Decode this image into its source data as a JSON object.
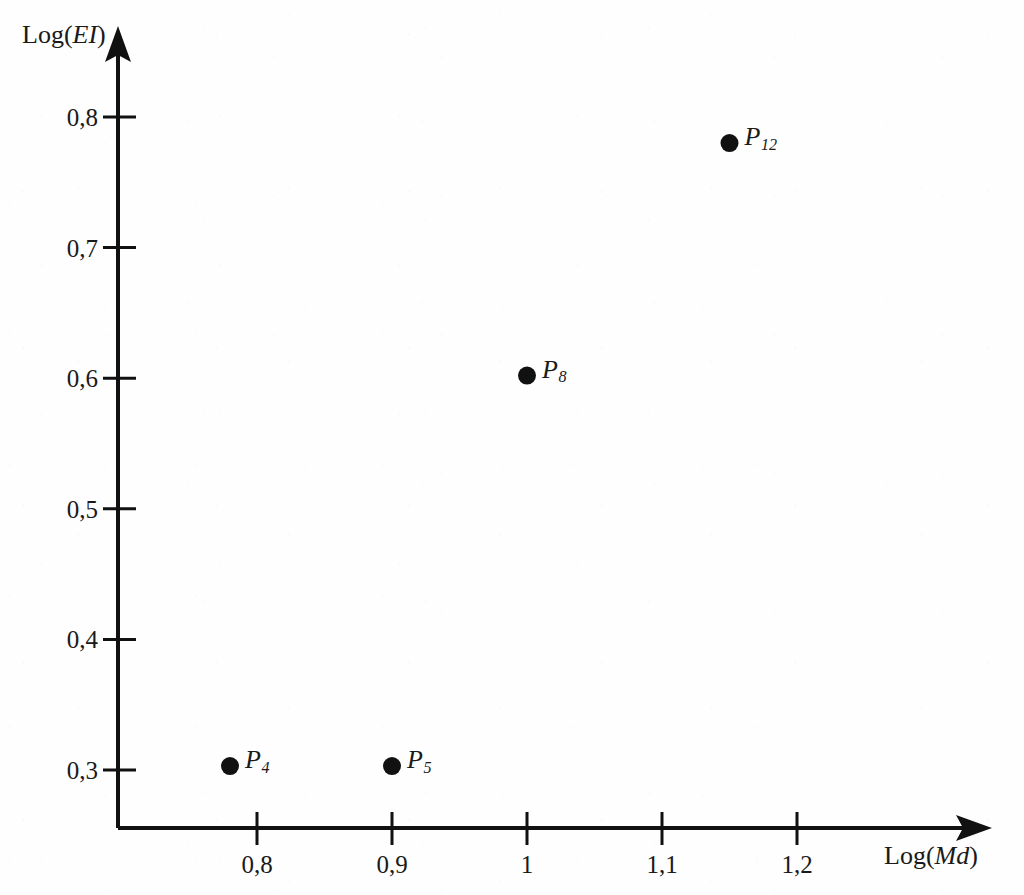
{
  "figure": {
    "background_color": "#fefefe",
    "ink_color": "#111111",
    "width": 1024,
    "height": 895
  },
  "chart_data": {
    "type": "scatter",
    "title": "",
    "xlabel": "Log(Md)",
    "ylabel": "Log(EI)",
    "xlabel_parts": {
      "prefix": "Log(",
      "italic": "Md",
      "suffix": ")"
    },
    "ylabel_parts": {
      "prefix": "Log(",
      "italic": "EI",
      "suffix": ")"
    },
    "xlim": [
      0.74,
      1.28
    ],
    "ylim": [
      0.265,
      0.83
    ],
    "xticks": [
      0.8,
      0.9,
      1.0,
      1.1,
      1.2
    ],
    "yticks": [
      0.3,
      0.4,
      0.5,
      0.6,
      0.7,
      0.8
    ],
    "xticklabels": [
      "0,8",
      "0,9",
      "1",
      "1,1",
      "1,2"
    ],
    "yticklabels": [
      "0,3",
      "0,4",
      "0,5",
      "0,6",
      "0,7",
      "0,8"
    ],
    "decimal_separator": ",",
    "grid": false,
    "legend": "none",
    "axis_style": "arrow-terminated",
    "marker": "filled-circle",
    "points": [
      {
        "label": "P",
        "subscript": "4",
        "x": 0.78,
        "y": 0.303,
        "label_side": "right"
      },
      {
        "label": "P",
        "subscript": "5",
        "x": 0.9,
        "y": 0.303,
        "label_side": "right"
      },
      {
        "label": "P",
        "subscript": "8",
        "x": 1.0,
        "y": 0.602,
        "label_side": "right"
      },
      {
        "label": "P",
        "subscript": "12",
        "x": 1.15,
        "y": 0.78,
        "label_side": "right"
      }
    ]
  }
}
